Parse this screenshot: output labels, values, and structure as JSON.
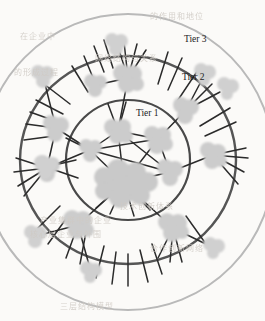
{
  "figure": {
    "kind": "concentric-tier-network-diagram",
    "medium": "photocopied / scanned page",
    "background_color": "#fbfaf8",
    "width": 265,
    "height": 321
  },
  "palette": {
    "paper": "#fbfaf8",
    "node_fill": "#c9c9c9",
    "node_fill_light": "#d4d4d4",
    "node_fill_dark": "#bdbdbd",
    "edge_stroke": "#2b2b2b",
    "ring_inner_stroke": "#4a4a4a",
    "ring_middle_stroke": "#555555",
    "ring_outer_stroke": "#b9b9b9",
    "label_color": "#1c1c1c",
    "bleed_text_color": "#cfcac4"
  },
  "labels": {
    "tier1": "Tier 1",
    "tier2": "Tier 2",
    "tier3": "Tier 3"
  },
  "rings": [
    {
      "id": "tier1",
      "label": "Tier 1",
      "cx": 128,
      "cy": 160,
      "rx": 62,
      "ry": 60,
      "stroke": "#4a4a4a",
      "stroke_width": 2.2,
      "label_x": 152,
      "label_y": 113
    },
    {
      "id": "tier2",
      "label": "Tier 2",
      "cx": 128,
      "cy": 160,
      "rx": 108,
      "ry": 104,
      "stroke": "#555555",
      "stroke_width": 2.4,
      "label_x": 196,
      "label_y": 77
    },
    {
      "id": "tier3",
      "label": "Tier 3",
      "cx": 128,
      "cy": 162,
      "rx": 146,
      "ry": 148,
      "stroke": "#b9b9b9",
      "stroke_width": 2.0,
      "label_x": 196,
      "label_y": 39
    }
  ],
  "nodes": [
    {
      "id": "hub-core",
      "tier": 1,
      "cx": 124,
      "cy": 183,
      "r": 27,
      "role": "central-hub"
    },
    {
      "id": "n-t1-a",
      "tier": 1,
      "cx": 118,
      "cy": 131,
      "r": 13,
      "role": "core"
    },
    {
      "id": "n-t1-b",
      "tier": 1,
      "cx": 158,
      "cy": 139,
      "r": 14,
      "role": "core"
    },
    {
      "id": "n-t1-c",
      "tier": 1,
      "cx": 90,
      "cy": 150,
      "r": 11,
      "role": "core"
    },
    {
      "id": "n-t1-d",
      "tier": 1,
      "cx": 170,
      "cy": 172,
      "r": 12,
      "role": "core"
    },
    {
      "id": "n-t2-n",
      "tier": 2,
      "cx": 128,
      "cy": 78,
      "r": 14,
      "role": "ring"
    },
    {
      "id": "n-t2-nw",
      "tier": 2,
      "cx": 96,
      "cy": 85,
      "r": 11,
      "role": "ring"
    },
    {
      "id": "n-t2-w",
      "tier": 2,
      "cx": 56,
      "cy": 128,
      "r": 13,
      "role": "ring"
    },
    {
      "id": "n-t2-wsw",
      "tier": 2,
      "cx": 47,
      "cy": 168,
      "r": 12,
      "role": "ring"
    },
    {
      "id": "n-t2-ne",
      "tier": 2,
      "cx": 186,
      "cy": 110,
      "r": 13,
      "role": "ring"
    },
    {
      "id": "n-t2-e",
      "tier": 2,
      "cx": 213,
      "cy": 155,
      "r": 13,
      "role": "ring"
    },
    {
      "id": "n-t2-s",
      "tier": 2,
      "cx": 78,
      "cy": 225,
      "r": 14,
      "role": "ring"
    },
    {
      "id": "n-t2-sse",
      "tier": 2,
      "cx": 173,
      "cy": 228,
      "r": 14,
      "role": "ring"
    },
    {
      "id": "n-t3-n",
      "tier": 3,
      "cx": 117,
      "cy": 44,
      "r": 11,
      "role": "outer"
    },
    {
      "id": "n-t3-nw",
      "tier": 3,
      "cx": 43,
      "cy": 76,
      "r": 11,
      "role": "outer"
    },
    {
      "id": "n-t3-nee",
      "tier": 3,
      "cx": 205,
      "cy": 74,
      "r": 10,
      "role": "outer"
    },
    {
      "id": "n-t3-ne2",
      "tier": 3,
      "cx": 228,
      "cy": 88,
      "r": 10,
      "role": "outer"
    },
    {
      "id": "n-t3-w",
      "tier": 3,
      "cx": 46,
      "cy": 167,
      "r": 11,
      "role": "outer"
    },
    {
      "id": "n-t3-sw",
      "tier": 3,
      "cx": 36,
      "cy": 236,
      "r": 11,
      "role": "outer"
    },
    {
      "id": "n-t3-s",
      "tier": 3,
      "cx": 91,
      "cy": 272,
      "r": 10,
      "role": "outer"
    },
    {
      "id": "n-t3-se",
      "tier": 3,
      "cx": 214,
      "cy": 248,
      "r": 10,
      "role": "outer"
    }
  ],
  "edges": [
    {
      "from": "hub-core",
      "to": "n-t1-a"
    },
    {
      "from": "hub-core",
      "to": "n-t1-b"
    },
    {
      "from": "hub-core",
      "to": "n-t1-c"
    },
    {
      "from": "hub-core",
      "to": "n-t1-d"
    },
    {
      "from": "n-t1-a",
      "to": "n-t1-b"
    },
    {
      "from": "n-t1-a",
      "to": "n-t1-c"
    },
    {
      "from": "n-t1-a",
      "to": "n-t1-d"
    },
    {
      "from": "n-t1-b",
      "to": "n-t1-d"
    },
    {
      "from": "n-t1-c",
      "to": "n-t1-d"
    },
    {
      "from": "n-t1-a",
      "to": "n-t2-n"
    },
    {
      "from": "n-t1-c",
      "to": "n-t2-w"
    },
    {
      "from": "n-t1-b",
      "to": "n-t2-ne"
    },
    {
      "from": "n-t1-d",
      "to": "n-t2-e"
    },
    {
      "from": "hub-core",
      "to": "n-t2-s"
    },
    {
      "from": "hub-core",
      "to": "n-t2-sse"
    },
    {
      "from": "n-t2-nw",
      "to": "n-t2-n"
    },
    {
      "from": "n-t2-w",
      "to": "n-t2-wsw"
    },
    {
      "from": "n-t2-wsw",
      "to": "n-t3-w"
    },
    {
      "from": "n-t2-s",
      "to": "n-t3-s"
    },
    {
      "from": "n-t2-sse",
      "to": "n-t3-se"
    },
    {
      "from": "n-t2-n",
      "to": "n-t3-n"
    },
    {
      "from": "n-t2-ne",
      "to": "n-t3-nee"
    }
  ],
  "bleed_text": [
    {
      "text": "的作用和地位",
      "x": 150,
      "y": 10,
      "size": 8,
      "rot": 0
    },
    {
      "text": "在企业中",
      "x": 20,
      "y": 30,
      "size": 8,
      "rot": 0
    },
    {
      "text": "网络结构与关系",
      "x": 95,
      "y": 52,
      "size": 8,
      "rot": 0
    },
    {
      "text": "的形成过程",
      "x": 14,
      "y": 66,
      "size": 8,
      "rot": 0
    },
    {
      "text": "技术创新体系",
      "x": 120,
      "y": 200,
      "size": 8,
      "rot": 0
    },
    {
      "text": "产业集群中的企业",
      "x": 40,
      "y": 214,
      "size": 8,
      "rot": 0
    },
    {
      "text": "核心层企业与外围",
      "x": 30,
      "y": 228,
      "size": 8,
      "rot": 0
    },
    {
      "text": "合作创新网络",
      "x": 150,
      "y": 242,
      "size": 8,
      "rot": 0
    },
    {
      "text": "三层结构模型",
      "x": 60,
      "y": 300,
      "size": 8,
      "rot": 0
    }
  ]
}
